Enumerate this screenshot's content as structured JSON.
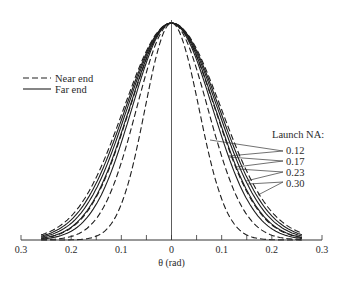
{
  "chart_data": {
    "type": "line",
    "title": "",
    "xlabel": "θ (rad)",
    "ylabel": "",
    "xlim": [
      -0.3,
      0.3
    ],
    "x_tick_labels": [
      "0.3",
      "0.2",
      "0.1",
      "0",
      "0.1",
      "0.2",
      "0.3"
    ],
    "x_tick_values": [
      -0.3,
      -0.2,
      -0.1,
      0,
      0.1,
      0.2,
      0.3
    ],
    "minor_tick_step": 0.05,
    "grid": false,
    "legend": {
      "position": "upper-left",
      "entries": [
        {
          "label": "Near end",
          "style": "dashed"
        },
        {
          "label": "Far end",
          "style": "solid"
        }
      ]
    },
    "annotation": {
      "title": "Launch NA:",
      "labels": [
        "0.12",
        "0.17",
        "0.23",
        "0.30"
      ]
    },
    "series": [
      {
        "name": "Near end, NA 0.12",
        "style": "dashed",
        "peak": 1.0,
        "hwhm_rad": 0.062
      },
      {
        "name": "Near end, NA 0.17",
        "style": "dashed",
        "peak": 1.0,
        "hwhm_rad": 0.082
      },
      {
        "name": "Near end, NA 0.23",
        "style": "dashed",
        "peak": 1.0,
        "hwhm_rad": 0.098
      },
      {
        "name": "Near end, NA 0.30",
        "style": "dashed",
        "peak": 1.0,
        "hwhm_rad": 0.112
      },
      {
        "name": "Far end, NA 0.12",
        "style": "solid",
        "peak": 1.0,
        "hwhm_rad": 0.093
      },
      {
        "name": "Far end, NA 0.17",
        "style": "solid",
        "peak": 1.0,
        "hwhm_rad": 0.099
      },
      {
        "name": "Far end, NA 0.23",
        "style": "solid",
        "peak": 1.0,
        "hwhm_rad": 0.104
      },
      {
        "name": "Far end, NA 0.30",
        "style": "solid",
        "peak": 1.0,
        "hwhm_rad": 0.108
      }
    ]
  }
}
